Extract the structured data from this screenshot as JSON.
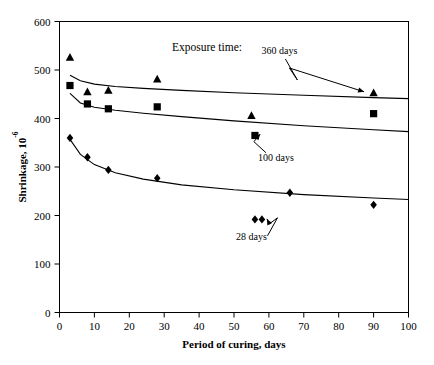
{
  "chart_data": {
    "type": "scatter",
    "title": "",
    "legend_title": "Exposure time:",
    "xlabel": "Period of curing, days",
    "ylabel": "Shrinkage, 10",
    "ylabel_exponent": "-6",
    "xlim": [
      0,
      100
    ],
    "ylim": [
      0,
      600
    ],
    "xticks": [
      0,
      10,
      20,
      30,
      40,
      50,
      60,
      70,
      80,
      90,
      100
    ],
    "yticks": [
      0,
      100,
      200,
      300,
      400,
      500,
      600
    ],
    "grid": false,
    "legend_position": "inline-annotations",
    "series": [
      {
        "name": "360 days",
        "marker": "triangle",
        "color": "#000000",
        "points": [
          {
            "x": 3,
            "y": 526
          },
          {
            "x": 8,
            "y": 455
          },
          {
            "x": 14,
            "y": 458
          },
          {
            "x": 28,
            "y": 481
          },
          {
            "x": 55,
            "y": 406
          },
          {
            "x": 90,
            "y": 453
          }
        ],
        "fit_curve": [
          {
            "x": 3,
            "y": 489
          },
          {
            "x": 6,
            "y": 478
          },
          {
            "x": 10,
            "y": 471
          },
          {
            "x": 16,
            "y": 466
          },
          {
            "x": 24,
            "y": 462
          },
          {
            "x": 35,
            "y": 458
          },
          {
            "x": 50,
            "y": 453
          },
          {
            "x": 70,
            "y": 448
          },
          {
            "x": 90,
            "y": 443
          },
          {
            "x": 100,
            "y": 441
          }
        ]
      },
      {
        "name": "100 days",
        "marker": "square",
        "color": "#000000",
        "points": [
          {
            "x": 3,
            "y": 468
          },
          {
            "x": 8,
            "y": 430
          },
          {
            "x": 14,
            "y": 420
          },
          {
            "x": 28,
            "y": 424
          },
          {
            "x": 56,
            "y": 365
          },
          {
            "x": 90,
            "y": 410
          }
        ],
        "fit_curve": [
          {
            "x": 3,
            "y": 452
          },
          {
            "x": 6,
            "y": 432
          },
          {
            "x": 10,
            "y": 423
          },
          {
            "x": 16,
            "y": 417
          },
          {
            "x": 24,
            "y": 411
          },
          {
            "x": 35,
            "y": 404
          },
          {
            "x": 50,
            "y": 395
          },
          {
            "x": 70,
            "y": 385
          },
          {
            "x": 90,
            "y": 377
          },
          {
            "x": 100,
            "y": 373
          }
        ]
      },
      {
        "name": "28 days",
        "marker": "diamond",
        "color": "#000000",
        "points": [
          {
            "x": 3,
            "y": 360
          },
          {
            "x": 8,
            "y": 320
          },
          {
            "x": 14,
            "y": 294
          },
          {
            "x": 28,
            "y": 277
          },
          {
            "x": 56,
            "y": 192
          },
          {
            "x": 58,
            "y": 192
          },
          {
            "x": 66,
            "y": 247
          },
          {
            "x": 90,
            "y": 222
          }
        ],
        "fit_curve": [
          {
            "x": 3,
            "y": 357
          },
          {
            "x": 6,
            "y": 326
          },
          {
            "x": 10,
            "y": 305
          },
          {
            "x": 16,
            "y": 288
          },
          {
            "x": 24,
            "y": 275
          },
          {
            "x": 35,
            "y": 263
          },
          {
            "x": 50,
            "y": 253
          },
          {
            "x": 70,
            "y": 243
          },
          {
            "x": 90,
            "y": 236
          },
          {
            "x": 100,
            "y": 233
          }
        ]
      }
    ],
    "annotations": [
      {
        "label": "360 days",
        "x": 63,
        "y": 533,
        "target_x": 89,
        "target_y": 455
      },
      {
        "label": "100 days",
        "x": 62,
        "y": 313,
        "target_x": 55.5,
        "target_y": 368
      },
      {
        "label": "28 days",
        "x": 55,
        "y": 150,
        "target_x": 58,
        "target_y": 193
      }
    ]
  }
}
